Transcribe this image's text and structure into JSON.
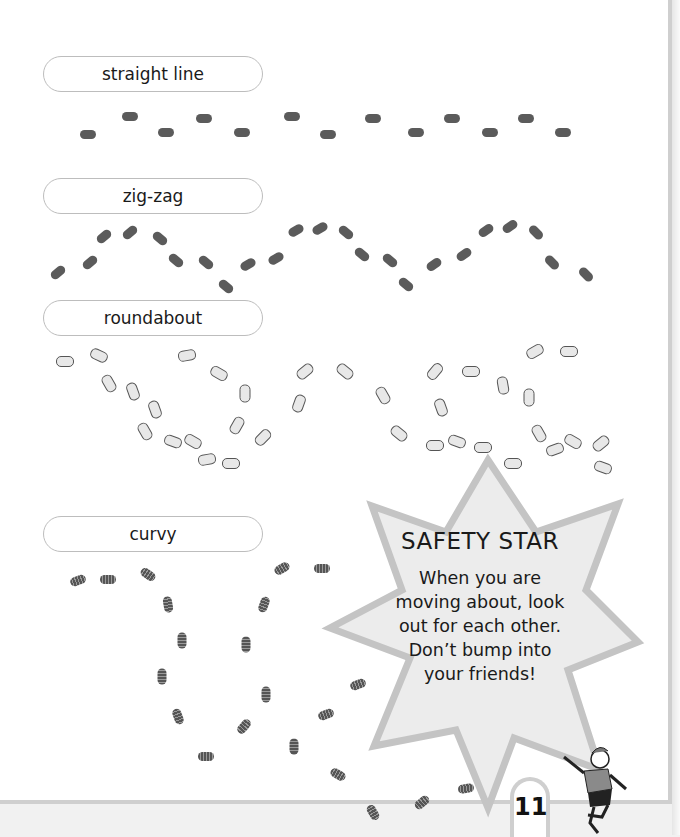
{
  "sections": [
    {
      "label": "straight line",
      "pattern": "straight-line"
    },
    {
      "label": "zig-zag",
      "pattern": "zig-zag"
    },
    {
      "label": "roundabout",
      "pattern": "roundabout"
    },
    {
      "label": "curvy",
      "pattern": "curvy"
    }
  ],
  "safety_star": {
    "title": "SAFETY STAR",
    "lines": [
      "When you are",
      "moving about, look",
      "out for each other.",
      "Don’t bump into",
      "your friends!"
    ]
  },
  "page_number": "11",
  "colors": {
    "page": "#ffffff",
    "border": "#cfcfcf",
    "star_fill": "#ececec",
    "footprint": "#5b5b5b"
  }
}
